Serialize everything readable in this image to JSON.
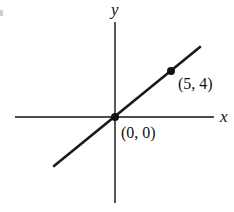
{
  "diagram": {
    "type": "coordinate-plane-line",
    "axes": {
      "x_label": "x",
      "y_label": "y"
    },
    "line": {
      "description": "straight line through origin and (5, 4)",
      "slope": "4/5"
    },
    "points": [
      {
        "label": "(0, 0)",
        "x": 0,
        "y": 0
      },
      {
        "label": "(5, 4)",
        "x": 5,
        "y": 4
      }
    ],
    "colors": {
      "ink": "#111111",
      "background": "#ffffff"
    }
  }
}
